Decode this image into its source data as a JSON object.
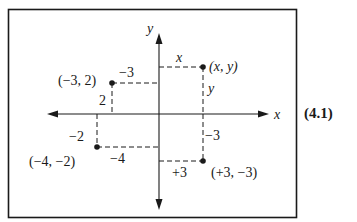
{
  "equation_number": "(4.1)",
  "axes": {
    "x_label": "x",
    "y_label": "y"
  },
  "points": [
    {
      "id": "general",
      "label": "(x, y)",
      "x_proj_label": "x",
      "y_proj_label": "y"
    },
    {
      "id": "p_neg3_2",
      "label": "(−3, 2)",
      "x_proj_label": "−3",
      "y_proj_label": "2"
    },
    {
      "id": "p_neg4_neg2",
      "label": "(−4, −2)",
      "x_proj_label": "−4",
      "y_proj_label": "−2"
    },
    {
      "id": "p_3_neg3",
      "label": "(+3, −3)",
      "x_proj_label": "+3",
      "y_proj_label": "−3"
    }
  ],
  "colors": {
    "ink": "#1a1a1a",
    "background": "#ffffff"
  }
}
